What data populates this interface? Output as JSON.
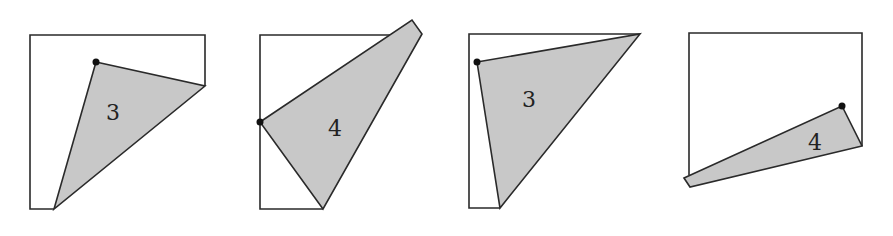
{
  "figures": [
    {
      "id": 1,
      "label": "3"
    },
    {
      "id": 2,
      "label": "4"
    },
    {
      "id": 3,
      "label": "3"
    },
    {
      "id": 4,
      "label": "4"
    }
  ],
  "colors": {
    "fill": "#c8c8c8",
    "stroke": "#2a2a2a",
    "dot": "#111111"
  }
}
